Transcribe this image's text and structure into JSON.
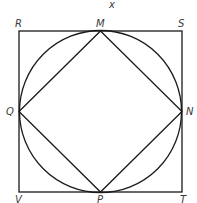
{
  "figure": {
    "top_label": "x",
    "outer_square": {
      "name": "RSTV",
      "vertices": [
        "R",
        "S",
        "T",
        "V"
      ]
    },
    "inner_square": {
      "name": "MNPQ",
      "vertices": [
        "M",
        "N",
        "P",
        "Q"
      ]
    },
    "circle": {
      "inscribed_in": "RSTV",
      "circumscribes": "MNPQ"
    },
    "labels": {
      "R": "R",
      "S": "S",
      "T": "T",
      "V": "V",
      "M": "M",
      "N": "N",
      "P": "P",
      "Q": "Q"
    },
    "colors": {
      "stroke": "#1a1a1a",
      "label": "#3a3a3a",
      "background": "#ffffff"
    }
  }
}
